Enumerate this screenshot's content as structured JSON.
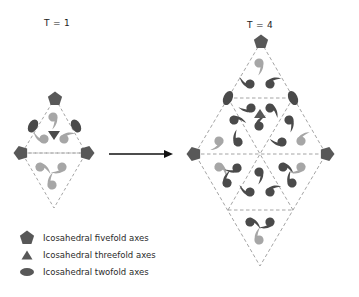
{
  "panels": [
    {
      "id": "t1",
      "label": "T = 1"
    },
    {
      "id": "t4",
      "label": "T = 4"
    }
  ],
  "legend": [
    {
      "symbol": "pentagon-icon",
      "label": "Icosahedral fivefold axes"
    },
    {
      "symbol": "triangle-icon",
      "label": "Icosahedral threefold axes"
    },
    {
      "symbol": "ellipse-icon",
      "label": "Icosahedral twofold axes"
    }
  ],
  "colors": {
    "symbol_dark": "#585858",
    "subunit_dark": "#4a4a4a",
    "subunit_light": "#a6a6a6",
    "dashed_line": "#9a9a9a",
    "arrow": "#111111"
  }
}
